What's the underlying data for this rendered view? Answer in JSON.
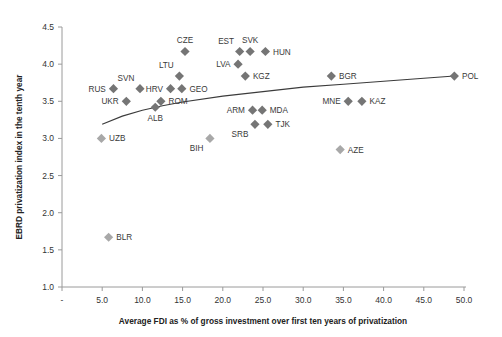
{
  "chart_data": {
    "type": "scatter",
    "title": "",
    "xlabel": "Average FDI as % of gross investment over first ten years of privatization",
    "ylabel": "EBRD privatization index in the tenth year",
    "xlim": [
      0,
      50
    ],
    "ylim": [
      1.0,
      4.5
    ],
    "xticks": [
      "-",
      "5.0",
      "10.0",
      "15.0",
      "20.0",
      "25.0",
      "30.0",
      "35.0",
      "40.0",
      "45.0",
      "50.0"
    ],
    "yticks": [
      "1.0",
      "1.5",
      "2.0",
      "2.5",
      "3.0",
      "3.5",
      "4.0",
      "4.5"
    ],
    "grid": false,
    "legend": "none",
    "marker_shape": "diamond",
    "marker_color": "#757575",
    "marker_color_light": "#a8a8a8",
    "trendline": {
      "present": true,
      "description": "logarithmic fit rising from left to right",
      "color": "#3b3b3b",
      "points": [
        [
          5.0,
          3.19
        ],
        [
          7.5,
          3.3
        ],
        [
          10.0,
          3.38
        ],
        [
          12.5,
          3.44
        ],
        [
          15.0,
          3.49
        ],
        [
          20.0,
          3.57
        ],
        [
          25.0,
          3.63
        ],
        [
          30.0,
          3.69
        ],
        [
          35.0,
          3.73
        ],
        [
          40.0,
          3.77
        ],
        [
          45.0,
          3.81
        ],
        [
          48.8,
          3.84
        ]
      ]
    },
    "points": [
      {
        "label": "RUS",
        "x": 6.4,
        "y": 3.67,
        "label_pos": "left",
        "shade": "dark"
      },
      {
        "label": "UKR",
        "x": 8.0,
        "y": 3.5,
        "label_pos": "left",
        "shade": "dark"
      },
      {
        "label": "SVN",
        "x": 9.7,
        "y": 3.67,
        "label_pos": "above-left",
        "shade": "dark"
      },
      {
        "label": "UZB",
        "x": 4.9,
        "y": 3.0,
        "label_pos": "right",
        "shade": "light"
      },
      {
        "label": "BLR",
        "x": 5.8,
        "y": 1.67,
        "label_pos": "right",
        "shade": "light"
      },
      {
        "label": "LTU",
        "x": 14.6,
        "y": 3.84,
        "label_pos": "above-left",
        "shade": "dark"
      },
      {
        "label": "CZE",
        "x": 15.3,
        "y": 4.17,
        "label_pos": "above",
        "shade": "dark"
      },
      {
        "label": "HRV",
        "x": 13.5,
        "y": 3.67,
        "label_pos": "left",
        "shade": "dark"
      },
      {
        "label": "GEO",
        "x": 14.9,
        "y": 3.67,
        "label_pos": "right",
        "shade": "dark"
      },
      {
        "label": "ROM",
        "x": 12.3,
        "y": 3.5,
        "label_pos": "right",
        "shade": "dark"
      },
      {
        "label": "ALB",
        "x": 11.6,
        "y": 3.42,
        "label_pos": "below",
        "shade": "dark"
      },
      {
        "label": "BIH",
        "x": 18.4,
        "y": 3.0,
        "label_pos": "below-left",
        "shade": "light"
      },
      {
        "label": "EST",
        "x": 22.1,
        "y": 4.17,
        "label_pos": "above-left",
        "shade": "dark"
      },
      {
        "label": "SVK",
        "x": 23.4,
        "y": 4.17,
        "label_pos": "above",
        "shade": "dark"
      },
      {
        "label": "HUN",
        "x": 25.3,
        "y": 4.17,
        "label_pos": "right",
        "shade": "dark"
      },
      {
        "label": "LVA",
        "x": 21.9,
        "y": 4.0,
        "label_pos": "left",
        "shade": "dark"
      },
      {
        "label": "KGZ",
        "x": 22.8,
        "y": 3.84,
        "label_pos": "right",
        "shade": "dark"
      },
      {
        "label": "ARM",
        "x": 23.7,
        "y": 3.38,
        "label_pos": "left",
        "shade": "dark"
      },
      {
        "label": "MDA",
        "x": 24.9,
        "y": 3.38,
        "label_pos": "right",
        "shade": "dark"
      },
      {
        "label": "SRB",
        "x": 24.0,
        "y": 3.19,
        "label_pos": "below-left",
        "shade": "dark"
      },
      {
        "label": "TJK",
        "x": 25.6,
        "y": 3.19,
        "label_pos": "right",
        "shade": "dark"
      },
      {
        "label": "BGR",
        "x": 33.5,
        "y": 3.84,
        "label_pos": "right",
        "shade": "dark"
      },
      {
        "label": "MNE",
        "x": 35.6,
        "y": 3.5,
        "label_pos": "left",
        "shade": "dark"
      },
      {
        "label": "KAZ",
        "x": 37.3,
        "y": 3.5,
        "label_pos": "right",
        "shade": "dark"
      },
      {
        "label": "AZE",
        "x": 34.6,
        "y": 2.85,
        "label_pos": "right",
        "shade": "light"
      },
      {
        "label": "POL",
        "x": 48.8,
        "y": 3.84,
        "label_pos": "right",
        "shade": "dark"
      }
    ]
  }
}
